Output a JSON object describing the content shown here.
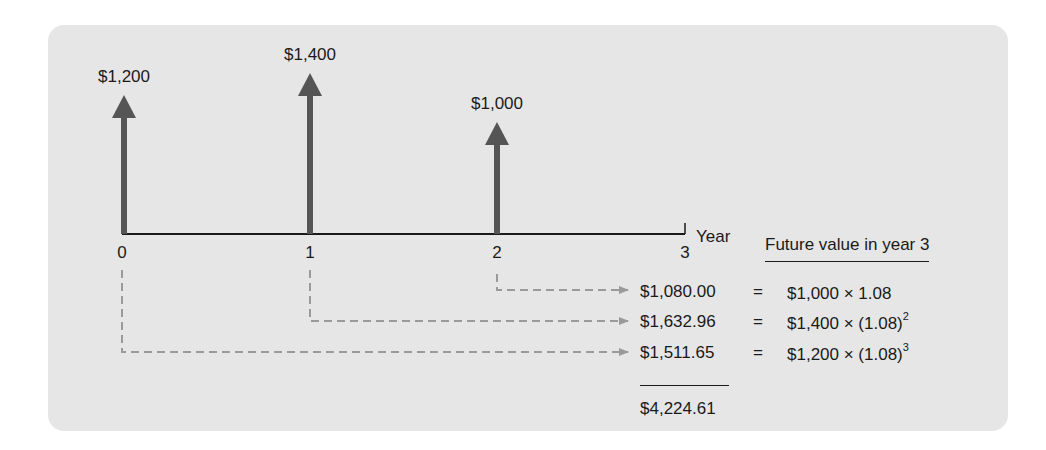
{
  "diagram": {
    "axis_label": "Year",
    "ticks": [
      "0",
      "1",
      "2",
      "3"
    ],
    "cash_flows": [
      {
        "year": "0",
        "amount": "$1,200"
      },
      {
        "year": "1",
        "amount": "$1,400"
      },
      {
        "year": "2",
        "amount": "$1,000"
      }
    ],
    "colors": {
      "panel": "#e6e6e6",
      "arrow": "#555555",
      "dashed": "#9a9a9a",
      "text": "#1a1a1a"
    }
  },
  "future_values": {
    "header": "Future value in year 3",
    "rows": [
      {
        "value": "$1,080.00",
        "eq": "=",
        "base": "$1,000 × 1.08",
        "exponent": ""
      },
      {
        "value": "$1,632.96",
        "eq": "=",
        "base": "$1,400 × (1.08)",
        "exponent": "2"
      },
      {
        "value": "$1,511.65",
        "eq": "=",
        "base": "$1,200 × (1.08)",
        "exponent": "3"
      }
    ],
    "total": "$4,224.61"
  }
}
